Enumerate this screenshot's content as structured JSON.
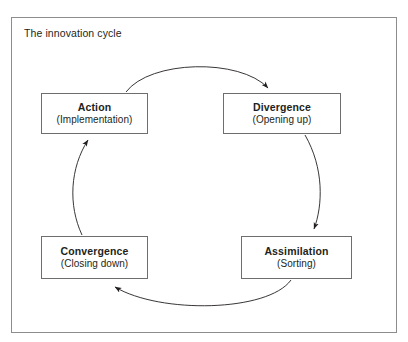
{
  "figure": {
    "caption": "The innovation cycle",
    "border_color": "#8d8d8d",
    "background": "#ffffff",
    "text_color": "#231f20"
  },
  "diagram": {
    "type": "cycle",
    "direction": "clockwise",
    "nodes": [
      {
        "id": "action",
        "title": "Action",
        "subtitle": "(Implementation)",
        "position": "top-left"
      },
      {
        "id": "divergence",
        "title": "Divergence",
        "subtitle": "(Opening up)",
        "position": "top-right"
      },
      {
        "id": "assimilation",
        "title": "Assimilation",
        "subtitle": "(Sorting)",
        "position": "bottom-right"
      },
      {
        "id": "convergence",
        "title": "Convergence",
        "subtitle": "(Closing down)",
        "position": "bottom-left"
      }
    ],
    "edges": [
      {
        "id": "action-to-divergence",
        "from": "action",
        "to": "divergence",
        "style": "curved-arrow"
      },
      {
        "id": "divergence-to-assimilation",
        "from": "divergence",
        "to": "assimilation",
        "style": "curved-arrow"
      },
      {
        "id": "assimilation-to-convergence",
        "from": "assimilation",
        "to": "convergence",
        "style": "curved-arrow"
      },
      {
        "id": "convergence-to-action",
        "from": "convergence",
        "to": "action",
        "style": "curved-arrow"
      }
    ]
  }
}
